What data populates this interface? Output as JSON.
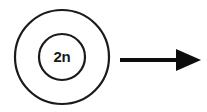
{
  "diagram": {
    "type": "cell-division-schematic",
    "background_color": "#ffffff",
    "stroke_color": "#1a1a1a",
    "cell": {
      "name": "diploid-cell",
      "membrane": {
        "label": "cell-membrane",
        "center_x": 62,
        "center_y": 57,
        "radius": 47,
        "stroke_width": 2.2,
        "fill": "#ffffff"
      },
      "nucleus": {
        "label": "nucleus",
        "center_x": 62,
        "center_y": 57,
        "radius": 23,
        "stroke_width": 2.2,
        "fill": "#ffffff",
        "text": "2n",
        "text_x": 62,
        "text_y": 62,
        "text_color": "#1a1a1a",
        "text_size": 15
      }
    },
    "arrow": {
      "label": "process-arrow",
      "direction": "right",
      "color": "#0d0d0d",
      "shaft_x1": 120,
      "shaft_x2": 179,
      "shaft_y": 60,
      "shaft_width": 4,
      "head_back_x": 176,
      "head_tip_x": 201,
      "head_top_y": 49,
      "head_bottom_y": 71
    }
  }
}
